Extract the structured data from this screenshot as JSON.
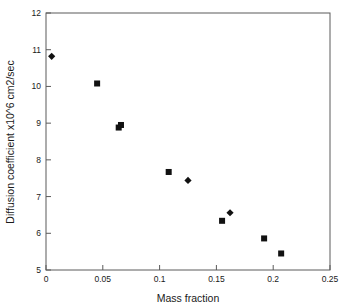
{
  "chart_data": {
    "type": "scatter",
    "title": "",
    "xlabel": "Mass fraction",
    "ylabel": "Diffusion coefficient x10^6 cm2/sec",
    "xlim": [
      0,
      0.25
    ],
    "ylim": [
      5,
      12
    ],
    "grid": false,
    "legend": "none",
    "xticks": [
      0,
      0.05,
      0.1,
      0.15,
      0.2,
      0.25
    ],
    "xtick_labels": [
      "0",
      "0.05",
      "0.1",
      "0.15",
      "0.2",
      "0.25"
    ],
    "yticks": [
      5,
      6,
      7,
      8,
      9,
      10,
      11,
      12
    ],
    "ytick_labels": [
      "5",
      "6",
      "7",
      "8",
      "9",
      "10",
      "11",
      "12"
    ],
    "series": [
      {
        "name": "diamond-series",
        "marker": "diamond",
        "color": "#111111",
        "points": [
          {
            "x": 0.005,
            "y": 10.82
          },
          {
            "x": 0.125,
            "y": 7.44
          },
          {
            "x": 0.162,
            "y": 6.56
          }
        ]
      },
      {
        "name": "square-series",
        "marker": "square",
        "color": "#111111",
        "points": [
          {
            "x": 0.045,
            "y": 10.08
          },
          {
            "x": 0.064,
            "y": 8.88
          },
          {
            "x": 0.066,
            "y": 8.95
          },
          {
            "x": 0.108,
            "y": 7.67
          },
          {
            "x": 0.155,
            "y": 6.34
          },
          {
            "x": 0.192,
            "y": 5.86
          },
          {
            "x": 0.207,
            "y": 5.45
          }
        ]
      }
    ]
  }
}
